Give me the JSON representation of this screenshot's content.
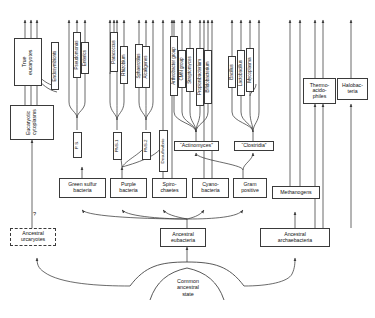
{
  "figure": {
    "background_color": "#ffffff",
    "line_color": "#3a3a3a",
    "text_color": "#111111"
  },
  "question_mark": "?",
  "root": {
    "label": "Common\nancestral\nstate"
  },
  "ancestors": [
    {
      "id": "ancestral-urcaryotes",
      "label": "Ancestral\nurcaryotes",
      "style": "dashed"
    },
    {
      "id": "ancestral-eubacteria",
      "label": "Ancestral\neubacteria",
      "style": "solid"
    },
    {
      "id": "ancestral-archaebacteria",
      "label": "Ancestral\narchaebacteria",
      "style": "solid"
    }
  ],
  "eubacterial_lineages": [
    {
      "id": "green-sulfur-bacteria",
      "label": "Green sulfur\nbacteria"
    },
    {
      "id": "purple-bacteria",
      "label": "Purple\nbacteria"
    },
    {
      "id": "spirochaetes",
      "label": "Spiro-\nchaetes"
    },
    {
      "id": "cyanobacteria",
      "label": "Cyano-\nbacteria"
    },
    {
      "id": "gram-positive",
      "label": "Gram\npositive"
    }
  ],
  "archaebacterial_lineages": [
    {
      "id": "methanogens",
      "label": "Methanogens"
    },
    {
      "id": "thermoacidophiles",
      "label": "Thermo-\nacido-\nphiles"
    },
    {
      "id": "halobacteria",
      "label": "Halobac-\nteria"
    }
  ],
  "eucaryote_lineages": [
    {
      "id": "eucaryotic-cytoplasms",
      "label": "Eucaryotic\ncytoplasms"
    },
    {
      "id": "true-eucaryotes",
      "label": "True\neucaryotes"
    },
    {
      "id": "endosymbionts",
      "label": "Endosymbionts"
    }
  ],
  "subgroups": [
    {
      "id": "ps",
      "label": "P. S."
    },
    {
      "id": "pns-1",
      "label": "PNS-1"
    },
    {
      "id": "pns-2",
      "label": "PNS-2"
    },
    {
      "id": "desulfovibrio",
      "label": "Desulfovibrio"
    },
    {
      "id": "actinomyces",
      "label": "“Actinomyces”"
    },
    {
      "id": "clostridia",
      "label": "“Clostridia”"
    }
  ],
  "taxa": [
    {
      "id": "pseudomonas",
      "label": "Pseudomonas",
      "group": "ps"
    },
    {
      "id": "enterics",
      "label": "Enterics",
      "group": "ps"
    },
    {
      "id": "paracoccus",
      "label": "Paracoccus",
      "group": "pns-1"
    },
    {
      "id": "rhizobium",
      "label": "Rhizobium",
      "group": "pns-1"
    },
    {
      "id": "sphaerotilus",
      "label": "Sphaerotilus",
      "group": "pns-2"
    },
    {
      "id": "alcaligenes",
      "label": "Alcaligenes",
      "group": "pns-2"
    },
    {
      "id": "arthrobacter-group",
      "label": "Arthrobacter group",
      "group": "actinomyces"
    },
    {
      "id": "cmn-group",
      "label": "CMN group",
      "group": "actinomyces"
    },
    {
      "id": "streptomyces",
      "label": "Streptomyces",
      "group": "actinomyces"
    },
    {
      "id": "propionibacterium",
      "label": "Propionibacterium",
      "group": "actinomyces"
    },
    {
      "id": "bifidobacterium",
      "label": "Bifidobacterium",
      "group": "actinomyces"
    },
    {
      "id": "bacillus",
      "label": "Bacillus",
      "group": "clostridia"
    },
    {
      "id": "lactobacillus",
      "label": "Lactobacillus",
      "group": "clostridia"
    },
    {
      "id": "mycoplasma",
      "label": "Mycoplasma",
      "group": "clostridia"
    }
  ]
}
